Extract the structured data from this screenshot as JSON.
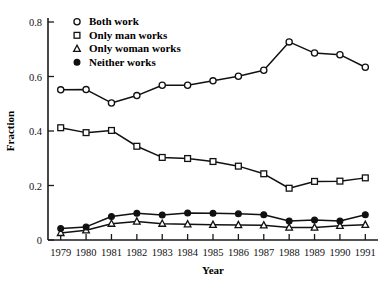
{
  "chart_data": {
    "type": "line",
    "title": "",
    "xlabel": "Year",
    "ylabel": "Fraction",
    "x": [
      1979,
      1980,
      1981,
      1982,
      1983,
      1984,
      1985,
      1986,
      1987,
      1988,
      1989,
      1990,
      1991
    ],
    "xlim": [
      1978.5,
      1991.5
    ],
    "ylim": [
      0,
      0.8
    ],
    "yticks": [
      0,
      0.2,
      0.4,
      0.6,
      0.8
    ],
    "ytick_labels": [
      "0",
      "0.2",
      "0.4",
      "0.6",
      "0.8"
    ],
    "xtick_labels": [
      "1979",
      "1980",
      "1981",
      "1982",
      "1983",
      "1984",
      "1985",
      "1986",
      "1987",
      "1988",
      "1989",
      "1990",
      "1991"
    ],
    "grid": false,
    "legend_position": "top-left inside",
    "series": [
      {
        "name": "Both work",
        "marker": "open-circle",
        "values": [
          0.551,
          0.552,
          0.503,
          0.53,
          0.568,
          0.568,
          0.584,
          0.601,
          0.623,
          0.727,
          0.686,
          0.68,
          0.634
        ]
      },
      {
        "name": "Only man works",
        "marker": "open-square",
        "values": [
          0.412,
          0.394,
          0.402,
          0.344,
          0.303,
          0.299,
          0.288,
          0.271,
          0.243,
          0.19,
          0.215,
          0.216,
          0.228
        ]
      },
      {
        "name": "Only woman works",
        "marker": "open-triangle",
        "values": [
          0.026,
          0.036,
          0.06,
          0.068,
          0.06,
          0.058,
          0.056,
          0.055,
          0.054,
          0.046,
          0.046,
          0.052,
          0.056
        ]
      },
      {
        "name": "Neither works",
        "marker": "filled-circle",
        "values": [
          0.042,
          0.048,
          0.086,
          0.098,
          0.092,
          0.099,
          0.098,
          0.096,
          0.093,
          0.07,
          0.073,
          0.07,
          0.093
        ]
      }
    ]
  },
  "legend": {
    "items": [
      {
        "label": "Both work",
        "marker": "open-circle"
      },
      {
        "label": "Only man works",
        "marker": "open-square"
      },
      {
        "label": "Only woman works",
        "marker": "open-triangle"
      },
      {
        "label": "Neither works",
        "marker": "filled-circle"
      }
    ]
  },
  "colors": {
    "ink": "#111111",
    "background": "#ffffff"
  }
}
